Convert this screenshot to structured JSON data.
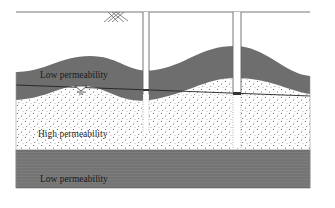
{
  "diagram": {
    "type": "hydrogeologic cross-section",
    "layers": [
      {
        "id": "upper-confining",
        "label": "Low permeability",
        "fill": "#6e6e6e",
        "text_color": "#1a1a1a"
      },
      {
        "id": "aquifer",
        "label": "High permeability",
        "fill": "#ffffff",
        "stipple": "#555555",
        "text_color": "#2a2a2a"
      },
      {
        "id": "lower-confining",
        "label": "Low permeability",
        "fill": "#7a7a7a",
        "text_color": "#1a1a1a"
      }
    ],
    "wells": [
      {
        "id": "well-1",
        "screened": false
      },
      {
        "id": "well-2",
        "screened": true
      }
    ],
    "symbols": {
      "ground_surface_hatch": "crosshatch",
      "water_table": "inverted-triangle"
    },
    "colors": {
      "outline": "#555555",
      "potentiometric_line": "#222222",
      "background": "#ffffff"
    }
  }
}
